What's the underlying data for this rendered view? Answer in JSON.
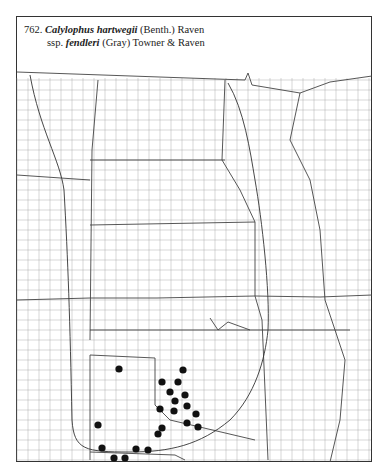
{
  "title": {
    "number": "762.",
    "genus_species": "Calylophus hartwegii",
    "author1": "(Benth.) Raven",
    "ssp_prefix": "ssp.",
    "subspecies": "fendleri",
    "author2": "(Gray) Towner & Raven"
  },
  "map": {
    "region": "Central United States county map",
    "marker_color": "#111111",
    "line_color": "#555555",
    "occurrences": [
      [
        119,
        369
      ],
      [
        183,
        370
      ],
      [
        162,
        382
      ],
      [
        178,
        382
      ],
      [
        170,
        392
      ],
      [
        185,
        395
      ],
      [
        175,
        401
      ],
      [
        187,
        406
      ],
      [
        160,
        409
      ],
      [
        174,
        411
      ],
      [
        196,
        414
      ],
      [
        187,
        423
      ],
      [
        198,
        427
      ],
      [
        98,
        425
      ],
      [
        162,
        428
      ],
      [
        158,
        434
      ],
      [
        102,
        448
      ],
      [
        136,
        449
      ],
      [
        148,
        450
      ],
      [
        114,
        458
      ],
      [
        125,
        458
      ]
    ]
  }
}
